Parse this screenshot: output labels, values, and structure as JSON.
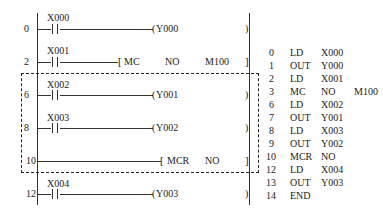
{
  "ladder": {
    "rungs": [
      {
        "step": "0",
        "contact": "X000",
        "output": "Y000",
        "type": "coil"
      },
      {
        "step": "2",
        "contact": "X001",
        "instr": "MC",
        "arg1": "NO",
        "arg2": "M100",
        "type": "func"
      },
      {
        "step": "6",
        "contact": "X002",
        "output": "Y001",
        "type": "coil"
      },
      {
        "step": "8",
        "contact": "X003",
        "output": "Y002",
        "type": "coil"
      },
      {
        "step": "10",
        "instr": "MCR",
        "arg1": "NO",
        "type": "func"
      },
      {
        "step": "12",
        "contact": "X004",
        "output": "Y003",
        "type": "coil"
      }
    ]
  },
  "instruction_list": [
    {
      "step": "0",
      "op": "LD",
      "arg1": "X000",
      "arg2": ""
    },
    {
      "step": "1",
      "op": "OUT",
      "arg1": "Y000",
      "arg2": ""
    },
    {
      "step": "2",
      "op": "LD",
      "arg1": "X001",
      "arg2": ""
    },
    {
      "step": "3",
      "op": "MC",
      "arg1": "NO",
      "arg2": "M100"
    },
    {
      "step": "6",
      "op": "LD",
      "arg1": "X002",
      "arg2": ""
    },
    {
      "step": "7",
      "op": "OUT",
      "arg1": "Y001",
      "arg2": ""
    },
    {
      "step": "8",
      "op": "LD",
      "arg1": "X003",
      "arg2": ""
    },
    {
      "step": "9",
      "op": "OUT",
      "arg1": "Y002",
      "arg2": ""
    },
    {
      "step": "10",
      "op": "MCR",
      "arg1": "NO",
      "arg2": ""
    },
    {
      "step": "12",
      "op": "LD",
      "arg1": "X004",
      "arg2": ""
    },
    {
      "step": "13",
      "op": "OUT",
      "arg1": "Y003",
      "arg2": ""
    },
    {
      "step": "14",
      "op": "END",
      "arg1": "",
      "arg2": ""
    }
  ],
  "symbols": {
    "coil_open": "(",
    "coil_close": ")",
    "func_open": "[",
    "func_close": "]"
  }
}
